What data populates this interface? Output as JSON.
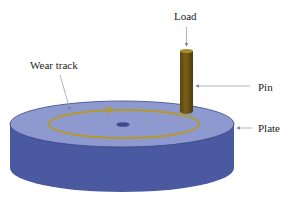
{
  "diagram": {
    "type": "pin-on-disc tribometer schematic",
    "labels": {
      "load": "Load",
      "pin": "Pin",
      "plate": "Plate",
      "wear_track": "Wear track"
    },
    "colors": {
      "plate_top": "#8e9acf",
      "plate_side": "#4a59a0",
      "plate_edge": "#3a4585",
      "wear_track": "#b39a2a",
      "pin": "#6b5414",
      "pin_top": "#a58a2e",
      "center_hole": "#3d4a92",
      "leader_line": "#9aa0b8",
      "text": "#222222"
    }
  }
}
